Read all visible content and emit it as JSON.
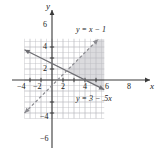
{
  "figure": {
    "title": "",
    "background_color": "#ffffff"
  },
  "chart_data": {
    "type": "line",
    "title": "",
    "xlabel": "x",
    "ylabel": "y",
    "xlim": [
      -5,
      9.5
    ],
    "ylim": [
      -7,
      7.5
    ],
    "grid": true,
    "grid_step": 1,
    "grid_color": "#b8b8bd",
    "axis_color": "#3a3a3a",
    "x_ticks": [
      -4,
      -2,
      2,
      4,
      6,
      8
    ],
    "x_tick_labels": [
      "−4",
      "−2",
      "2",
      "4",
      "6",
      "8"
    ],
    "y_ticks": [
      -6,
      -4,
      2,
      4,
      6
    ],
    "y_tick_labels": [
      "−6",
      "−4",
      "2",
      "4",
      "6"
    ],
    "legend_position": "none",
    "series": [
      {
        "name": "y = 3 − .5x",
        "label": "y = 3 − .5x",
        "equation": "y = 3 - 0.5x",
        "slope": -0.5,
        "intercept": 3,
        "style": "solid",
        "color": "#6e6e73",
        "arrows": "both",
        "points": [
          [
            -5,
            5.5
          ],
          [
            9.5,
            -1.75
          ]
        ]
      },
      {
        "name": "y = x − 1",
        "label": "y = x − 1",
        "equation": "y = x - 1",
        "slope": 1,
        "intercept": -1,
        "style": "dashed",
        "color": "#8c8c91",
        "arrows": "both",
        "points": [
          [
            -5,
            -6
          ],
          [
            8.4,
            7.4
          ]
        ]
      }
    ],
    "shaded_region": {
      "description": "wedge right of the intersection, above y = 3 − .5x and below y = x − 1",
      "fill": "#bdbdc2",
      "opacity": 0.55,
      "vertices": [
        [
          2.667,
          1.667
        ],
        [
          8.4,
          7.4
        ],
        [
          9.5,
          7.4
        ],
        [
          9.5,
          -1.75
        ]
      ]
    },
    "annotations": [
      {
        "text": "y = x − 1",
        "x": 4.6,
        "y": 5.2
      },
      {
        "text": "y = 3 − .5x",
        "x": 4.6,
        "y": -1.6
      }
    ]
  },
  "labels": {
    "x_axis": "x",
    "y_axis": "y",
    "x_neg4": "−4",
    "x_neg2": "−2",
    "x_2": "2",
    "x_4": "4",
    "x_6": "6",
    "x_8": "8",
    "y_6": "6",
    "y_4": "4",
    "y_2": "2",
    "y_neg4": "−4",
    "y_neg6": "−6",
    "eq_dashed": "y = x − 1",
    "eq_solid": "y = 3 − .5x"
  }
}
